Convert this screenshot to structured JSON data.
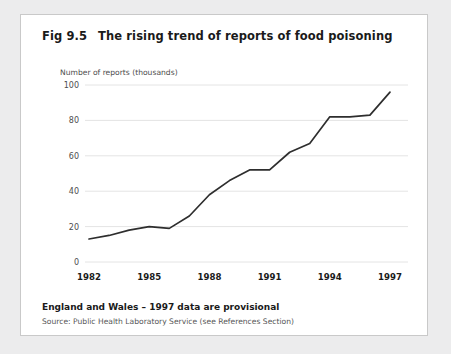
{
  "figure": {
    "number": "Fig 9.5",
    "title": "The rising trend of reports of food poisoning",
    "footer_note": "England and Wales – 1997 data are provisional",
    "source": "Source: Public Health Laboratory Service (see References Section)"
  },
  "colors": {
    "page_background": "#ececed",
    "panel_background": "#ffffff",
    "panel_border": "#c9c9c9",
    "line": "#2e2e2e",
    "gridline": "#e4e4e4",
    "tick_label": "#4d4d4d",
    "title_text": "#1a1a1a"
  },
  "chart_data": {
    "type": "line",
    "title": "The rising trend of reports of food poisoning",
    "xlabel": "",
    "ylabel": "Number of reports (thousands)",
    "xlim": [
      1982,
      1997
    ],
    "ylim": [
      0,
      100
    ],
    "grid": true,
    "legend": "none",
    "x": [
      1982,
      1983,
      1984,
      1985,
      1986,
      1987,
      1988,
      1989,
      1990,
      1991,
      1992,
      1993,
      1994,
      1995,
      1996,
      1997
    ],
    "y": [
      13,
      15,
      18,
      20,
      19,
      26,
      38,
      46,
      52,
      52,
      62,
      67,
      82,
      82,
      83,
      96
    ],
    "yticks": [
      0,
      20,
      40,
      60,
      80,
      100
    ],
    "ytick_labels": [
      "0",
      "20",
      "40",
      "60",
      "80",
      "100"
    ],
    "xticks": [
      1982,
      1985,
      1988,
      1991,
      1994,
      1997
    ],
    "xtick_labels": [
      "1982",
      "1985",
      "1988",
      "1991",
      "1994",
      "1997"
    ],
    "series": [
      {
        "name": "Reports of food poisoning",
        "values": [
          13,
          15,
          18,
          20,
          19,
          26,
          38,
          46,
          52,
          52,
          62,
          67,
          82,
          82,
          83,
          96
        ]
      }
    ]
  }
}
